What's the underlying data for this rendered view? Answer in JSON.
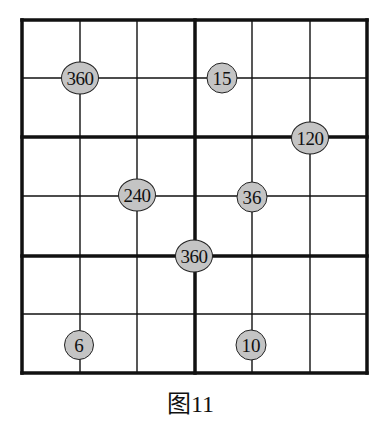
{
  "figure": {
    "caption": "图11",
    "grid": {
      "size": 6,
      "box_rows": 2,
      "box_cols": 3,
      "left": 22,
      "top": 20,
      "right": 367,
      "bottom": 373,
      "col_lines": [
        22,
        80,
        137,
        195,
        252,
        310,
        367
      ],
      "row_lines": [
        20,
        78,
        137,
        196,
        256,
        314,
        373
      ],
      "thick_cols": [
        0,
        3,
        6
      ],
      "thick_rows": [
        0,
        2,
        4,
        6
      ],
      "line_color": "#111111"
    },
    "clues": [
      {
        "value": "360",
        "x": 80,
        "y": 78
      },
      {
        "value": "15",
        "x": 222,
        "y": 78
      },
      {
        "value": "120",
        "x": 310,
        "y": 138
      },
      {
        "value": "240",
        "x": 137,
        "y": 195
      },
      {
        "value": "36",
        "x": 252,
        "y": 197
      },
      {
        "value": "360",
        "x": 194,
        "y": 256
      },
      {
        "value": "6",
        "x": 79,
        "y": 345
      },
      {
        "value": "10",
        "x": 251,
        "y": 345
      }
    ],
    "clue_fill": "#c4c4c4"
  }
}
